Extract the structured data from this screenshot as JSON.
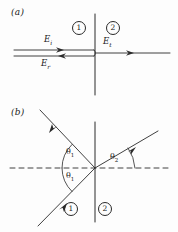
{
  "figure": {
    "ink_color": "#2a2a2a",
    "background_color": "#fdfdfd",
    "width": 178,
    "height": 232
  },
  "panels": [
    {
      "tag": "(a)",
      "description": "Normal incidence",
      "interface_x": 95,
      "axis_y": 52,
      "media": [
        {
          "label": "1",
          "cx": 78,
          "cy": 27
        },
        {
          "label": "2",
          "cx": 112,
          "cy": 27
        }
      ],
      "rays": [
        {
          "name": "incident",
          "label": "E",
          "sub": "i",
          "label_x": 44,
          "label_y": 39,
          "direction": "right"
        },
        {
          "name": "reflected",
          "label": "E",
          "sub": "r",
          "label_x": 41,
          "label_y": 62,
          "direction": "left"
        },
        {
          "name": "transmitted",
          "label": "E",
          "sub": "t",
          "label_x": 103,
          "label_y": 40,
          "direction": "right"
        }
      ]
    },
    {
      "tag": "(b)",
      "description": "Oblique incidence",
      "interface_x": 95,
      "axis_y": 168,
      "media": [
        {
          "label": "1",
          "cx": 70,
          "cy": 208
        },
        {
          "label": "2",
          "cx": 104,
          "cy": 208
        }
      ],
      "angles": [
        {
          "label": "θ",
          "sub": "1",
          "name": "reflection-angle",
          "label_x": 67,
          "label_y": 153
        },
        {
          "label": "θ",
          "sub": "1",
          "name": "incidence-angle",
          "label_x": 67,
          "label_y": 176
        },
        {
          "label": "θ",
          "sub": "2",
          "name": "refraction-angle",
          "label_x": 110,
          "label_y": 157
        }
      ],
      "rays": [
        {
          "name": "incident-ray",
          "from": [
            40,
            224
          ],
          "to": [
            95,
            168
          ]
        },
        {
          "name": "reflected-ray",
          "from": [
            95,
            168
          ],
          "to": [
            42,
            112
          ]
        },
        {
          "name": "transmitted-ray",
          "from": [
            95,
            168
          ],
          "to": [
            155,
            133
          ]
        }
      ]
    }
  ]
}
